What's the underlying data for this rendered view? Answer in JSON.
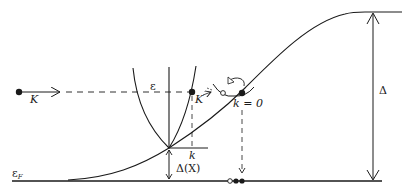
{
  "diagram": {
    "title": "",
    "labels": {
      "incoming_momentum": "K",
      "energy_axis": "ε",
      "particle_momentum": "K",
      "relative_momentum": "k",
      "gap_at_X": "Δ(X)",
      "bound_state": "k = 0",
      "fermi_level": "ε",
      "fermi_level_sub": "F",
      "gap": "Δ"
    },
    "elements": [
      {
        "id": "incoming-particle",
        "type": "filled-dot",
        "note": "particle with momentum K moving right"
      },
      {
        "id": "dispersion-parabola",
        "type": "parabola",
        "note": "energy dispersion ε(k) with minimum Δ(X)"
      },
      {
        "id": "gap-profile",
        "type": "sigmoid-curve",
        "note": "gap rises from ε_F to Δ"
      },
      {
        "id": "bound-pair",
        "type": "open-and-filled-dots",
        "note": "particle/hole pair at k = 0 with curly exchange arrow"
      },
      {
        "id": "fermi-level-dots",
        "type": "dots",
        "values": [
          "open",
          "filled",
          "filled"
        ]
      }
    ],
    "colors": {
      "ink": "#1a1a1a",
      "background": "#ffffff"
    }
  }
}
